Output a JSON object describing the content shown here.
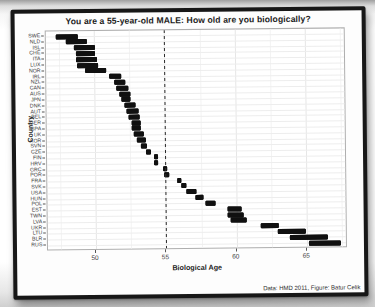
{
  "chart_data": {
    "type": "bar",
    "subtype": "horizontal-range-bars",
    "title": "You are a 55-year-old MALE: How old are you biologically?",
    "xlabel": "Biological Age",
    "ylabel": "Country",
    "caption": "Data: HMD 2011, Figure: Batur Celik",
    "x_ticks": [
      50,
      55,
      60,
      65
    ],
    "x_minor_gridlines": [
      47.5,
      52.5,
      57.5,
      62.5,
      67.5
    ],
    "xlim": [
      46.6,
      67.9
    ],
    "reference_line_x": 55,
    "reference_line_style": "dashed",
    "bar_color": "#101010",
    "grid": true,
    "legend": false,
    "countries": [
      {
        "code": "SWE",
        "range": [
          47.3,
          48.9
        ]
      },
      {
        "code": "NLD",
        "range": [
          48.0,
          49.5
        ]
      },
      {
        "code": "ISL",
        "range": [
          48.6,
          50.1
        ]
      },
      {
        "code": "CHE",
        "range": [
          48.7,
          50.1
        ]
      },
      {
        "code": "ITA",
        "range": [
          48.7,
          50.2
        ]
      },
      {
        "code": "LUX",
        "range": [
          48.8,
          50.3
        ]
      },
      {
        "code": "NOR",
        "range": [
          49.4,
          50.9
        ]
      },
      {
        "code": "IRL",
        "range": [
          51.1,
          51.9
        ]
      },
      {
        "code": "NZL",
        "range": [
          51.4,
          52.2
        ]
      },
      {
        "code": "CAN",
        "range": [
          51.6,
          52.4
        ]
      },
      {
        "code": "AUS",
        "range": [
          51.8,
          52.6
        ]
      },
      {
        "code": "JPN",
        "range": [
          51.9,
          52.6
        ]
      },
      {
        "code": "DNK",
        "range": [
          52.1,
          52.9
        ]
      },
      {
        "code": "AUT",
        "range": [
          52.3,
          53.1
        ]
      },
      {
        "code": "BEL",
        "range": [
          52.4,
          53.2
        ]
      },
      {
        "code": "GER",
        "range": [
          52.6,
          53.3
        ]
      },
      {
        "code": "SPA",
        "range": [
          52.6,
          53.3
        ]
      },
      {
        "code": "UK",
        "range": [
          52.8,
          53.5
        ]
      },
      {
        "code": "KOR",
        "range": [
          53.0,
          53.6
        ]
      },
      {
        "code": "SVN",
        "range": [
          53.3,
          53.7
        ]
      },
      {
        "code": "CZE",
        "range": [
          53.6,
          54.0
        ]
      },
      {
        "code": "FIN",
        "range": [
          54.2,
          54.5
        ]
      },
      {
        "code": "HRV",
        "range": [
          54.2,
          54.5
        ]
      },
      {
        "code": "GRC",
        "range": [
          54.8,
          55.1
        ]
      },
      {
        "code": "POR",
        "range": [
          54.9,
          55.3
        ]
      },
      {
        "code": "FRA",
        "range": [
          55.8,
          56.1
        ]
      },
      {
        "code": "SVK",
        "range": [
          56.1,
          56.5
        ]
      },
      {
        "code": "USA",
        "range": [
          56.5,
          57.2
        ]
      },
      {
        "code": "HUN",
        "range": [
          57.1,
          57.7
        ]
      },
      {
        "code": "POL",
        "range": [
          57.8,
          58.5
        ]
      },
      {
        "code": "EST",
        "range": [
          59.4,
          60.4
        ]
      },
      {
        "code": "TWN",
        "range": [
          59.4,
          60.5
        ]
      },
      {
        "code": "LVA",
        "range": [
          59.6,
          60.7
        ]
      },
      {
        "code": "UKR",
        "range": [
          61.7,
          63.0
        ]
      },
      {
        "code": "LTU",
        "range": [
          62.9,
          64.9
        ]
      },
      {
        "code": "BLR",
        "range": [
          63.8,
          66.5
        ]
      },
      {
        "code": "RUS",
        "range": [
          65.1,
          67.4
        ]
      }
    ]
  }
}
